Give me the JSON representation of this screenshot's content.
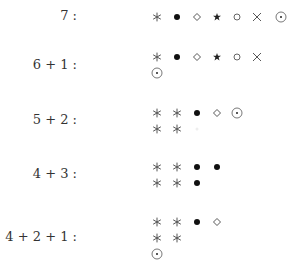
{
  "symbols": {
    "asterisk": "asterisk-icon",
    "bullet": "filled-circle-icon",
    "diamond": "diamond-icon",
    "star": "star-icon",
    "circle": "open-circle-icon",
    "cross": "times-icon",
    "odot": "circled-dot-icon"
  },
  "rows": [
    {
      "label": "7 :",
      "label_y": 17,
      "lines": [
        [
          "asterisk",
          "bullet",
          "diamond",
          "star",
          "circle",
          "cross",
          "odot"
        ]
      ],
      "line_y": [
        17
      ]
    },
    {
      "label": "6 + 1 :",
      "label_y": 66,
      "lines": [
        [
          "asterisk",
          "bullet",
          "diamond",
          "star",
          "circle",
          "cross"
        ],
        [
          "odot"
        ]
      ],
      "line_y": [
        57,
        73
      ]
    },
    {
      "label": "5 + 2 :",
      "label_y": 121,
      "lines": [
        [
          "asterisk",
          "asterisk",
          "bullet",
          "diamond",
          "odot"
        ],
        [
          "asterisk",
          "asterisk",
          "faint"
        ]
      ],
      "line_y": [
        113,
        129
      ]
    },
    {
      "label": "4 + 3 :",
      "label_y": 175,
      "lines": [
        [
          "asterisk",
          "asterisk",
          "bullet",
          "bullet"
        ],
        [
          "asterisk",
          "asterisk",
          "bullet"
        ]
      ],
      "line_y": [
        167,
        183
      ]
    },
    {
      "label": "4 + 2 + 1 :",
      "label_y": 238,
      "lines": [
        [
          "asterisk",
          "asterisk",
          "bullet",
          "diamond"
        ],
        [
          "asterisk",
          "asterisk"
        ],
        [
          "odot"
        ]
      ],
      "line_y": [
        222,
        238,
        254
      ]
    }
  ],
  "layout": {
    "column_x": [
      157,
      177,
      197,
      217,
      237,
      257,
      281
    ]
  }
}
